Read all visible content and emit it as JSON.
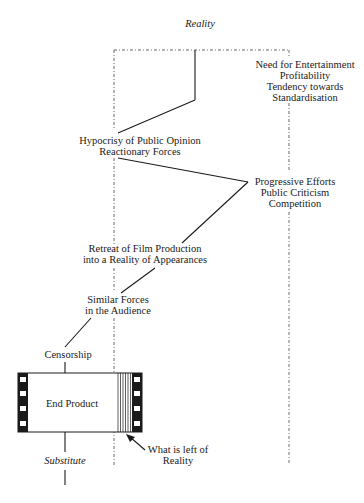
{
  "title": "Reality",
  "labels": {
    "forces_right_top": [
      "Need for Entertainment",
      "Profitability",
      "Tendency towards",
      "Standardisation"
    ],
    "hypocrisy": [
      "Hypocrisy of Public Opinion",
      "Reactionary Forces"
    ],
    "progressive": [
      "Progressive Efforts",
      "Public Criticism",
      "Competition"
    ],
    "retreat": [
      "Retreat of Film Production",
      "into a Reality of Appearances"
    ],
    "similar": [
      "Similar Forces",
      "in the Audience"
    ],
    "censorship": "Censorship",
    "end_product": "End Product",
    "what_is_left": [
      "What is left of",
      "Reality"
    ],
    "substitute": "Substitute"
  },
  "colors": {
    "ink": "#1a1a1a",
    "background": "#ffffff"
  }
}
